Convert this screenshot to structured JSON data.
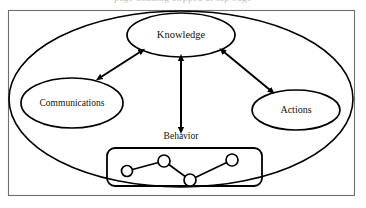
{
  "figure": {
    "width": 366,
    "height": 208,
    "background_color": "#ffffff",
    "stroke_color": "#000000",
    "frame_color": "#6f6f6f",
    "cropped_caption_fragment": "page heading clipped at top edge"
  },
  "nodes": {
    "knowledge": {
      "label": "Knowledge",
      "cx": 181,
      "cy": 35,
      "rx": 54,
      "ry": 22
    },
    "communications": {
      "label": "Communications",
      "cx": 72,
      "cy": 103,
      "rx": 51,
      "ry": 25
    },
    "actions": {
      "label": "Actions",
      "cx": 296,
      "cy": 110,
      "rx": 44,
      "ry": 20
    },
    "behavior": {
      "label": "Behavior",
      "cx": 181,
      "cy": 137
    }
  },
  "outer_ellipse": {
    "cx": 181,
    "cy": 99,
    "rx": 172,
    "ry": 88
  },
  "frame": {
    "x": 8,
    "y": 10,
    "width": 347,
    "height": 186
  },
  "behavior_box": {
    "x": 107,
    "y": 148,
    "width": 155,
    "height": 38,
    "corner_radius": 8
  },
  "network": {
    "nodes": [
      {
        "id": "n1",
        "cx": 127,
        "cy": 171,
        "r": 5.5
      },
      {
        "id": "n2",
        "cx": 164,
        "cy": 161,
        "r": 6.0
      },
      {
        "id": "n3",
        "cx": 190,
        "cy": 180,
        "r": 6.0
      },
      {
        "id": "n4",
        "cx": 232,
        "cy": 160,
        "r": 6.0
      }
    ],
    "edges": [
      {
        "from": "n1",
        "to": "n2"
      },
      {
        "from": "n2",
        "to": "n3"
      },
      {
        "from": "n3",
        "to": "n4"
      }
    ]
  },
  "arrows": [
    {
      "id": "knowledge-communications",
      "from": "Knowledge",
      "to": "Communications",
      "style": "double-headed",
      "x1": 140,
      "y1": 52,
      "x2": 101,
      "y2": 77
    },
    {
      "id": "knowledge-actions",
      "from": "Knowledge",
      "to": "Actions",
      "style": "double-headed",
      "x1": 224,
      "y1": 52,
      "x2": 270,
      "y2": 90
    },
    {
      "id": "knowledge-behavior",
      "from": "Knowledge",
      "to": "Behavior",
      "style": "double-headed",
      "x1": 181,
      "y1": 59,
      "x2": 181,
      "y2": 128
    }
  ]
}
